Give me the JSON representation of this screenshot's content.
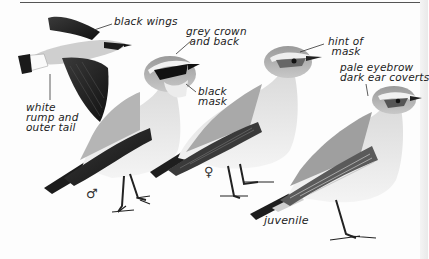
{
  "plate": {
    "subject": "Wheatear illustrations",
    "figures": [
      {
        "id": "male-flight",
        "caption": ""
      },
      {
        "id": "male-perched",
        "caption": "♂"
      },
      {
        "id": "female",
        "caption": "♀"
      },
      {
        "id": "juvenile",
        "caption": "juvenile"
      }
    ]
  },
  "labels": {
    "black_wings": "black wings",
    "grey_crown": "grey crown\n and back",
    "black_mask": "black\nmask",
    "white_rump": "white\nrump and\nouter tail",
    "hint_of_mask": "hint of\n mask",
    "pale_eyebrow": "pale eyebrow\ndark ear coverts"
  },
  "symbols": {
    "male": "♂",
    "female": "♀",
    "juvenile": "juvenile"
  },
  "colors": {
    "ink": "#222222",
    "wing_black": "#1e1e1e",
    "grey_back": "#a8a8a8",
    "pale_breast": "#e8e8e8",
    "white": "#fafafa"
  }
}
